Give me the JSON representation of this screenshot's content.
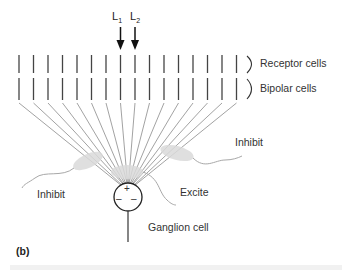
{
  "figure": {
    "panel_label": "(b)",
    "light_labels": [
      {
        "main": "L",
        "sub": "1"
      },
      {
        "main": "L",
        "sub": "2"
      }
    ],
    "layer_labels": {
      "receptor": "Receptor cells",
      "bipolar": "Bipolar cells"
    },
    "connection_labels": {
      "inhibit_left": "Inhibit",
      "inhibit_right": "Inhibit",
      "excite": "Excite"
    },
    "ganglion_label": "Ganglion cell",
    "ganglion_signs": {
      "center": "+",
      "surround_left": "–",
      "surround_right": "–"
    },
    "cell_count": 16,
    "colors": {
      "cell_line": "#444444",
      "fan_line": "#8a8a8a",
      "ellipse_fill": "#d9d9d9",
      "dendrite": "#a8a8a8"
    }
  }
}
